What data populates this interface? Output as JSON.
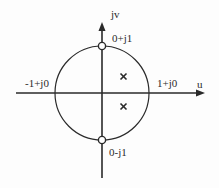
{
  "diagram": {
    "type": "complex-plane-unit-circle",
    "axes": {
      "horizontal_label": "u",
      "vertical_label": "jv"
    },
    "points": {
      "top": "0+j1",
      "bottom": "0-j1",
      "left": "-1+j0",
      "right": "1+j0"
    },
    "markers": {
      "zeros": [
        {
          "label": "0+j1",
          "shape": "open-circle"
        },
        {
          "label": "0-j1",
          "shape": "open-circle"
        }
      ],
      "poles": [
        {
          "shape": "cross",
          "position": "upper-right-inside"
        },
        {
          "shape": "cross",
          "position": "lower-right-inside"
        }
      ]
    },
    "colors": {
      "stroke": "#2a2a2a",
      "background": "#fdfdfd"
    }
  }
}
